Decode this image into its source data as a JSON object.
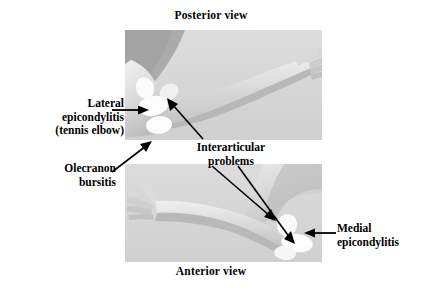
{
  "figure": {
    "kind": "anatomical-illustration",
    "background_color": "#ffffff",
    "text_color": "#000000"
  },
  "captions": {
    "top": "Posterior view",
    "bottom": "Anterior view"
  },
  "panels": [
    {
      "id": "posterior",
      "view": "Posterior view",
      "description": "Grayscale photograph of a right arm seen from behind, elbow at left, hand extended to the upper right",
      "markers": [
        {
          "name": "lateral-epicondyle-marker",
          "shape": "ellipse"
        },
        {
          "name": "olecranon-marker",
          "shape": "ellipse"
        },
        {
          "name": "joint-marker",
          "shape": "ellipse"
        }
      ]
    },
    {
      "id": "anterior",
      "view": "Anterior view",
      "description": "Grayscale photograph of an arm seen from the front, hand extended to the left, elbow at lower right",
      "markers": [
        {
          "name": "interarticular-marker",
          "shape": "ellipse"
        },
        {
          "name": "medial-epicondyle-marker",
          "shape": "ellipse"
        }
      ]
    }
  ],
  "annotations": [
    {
      "id": "lateral",
      "lines": [
        "Lateral",
        "epicondylitis",
        "(tennis elbow)"
      ],
      "text": "Lateral epicondylitis (tennis elbow)",
      "pointer": "arrow-right",
      "target_panel": "posterior"
    },
    {
      "id": "olecranon",
      "lines": [
        "Olecranon",
        "bursitis"
      ],
      "text": "Olecranon bursitis",
      "pointer": "arrow-up-right",
      "target_panel": "posterior"
    },
    {
      "id": "interarticular",
      "lines": [
        "Interarticular",
        "problems"
      ],
      "text": "Interarticular problems",
      "pointer": "arrow-up-left, arrow-down-right, arrow-down-right",
      "target_panel": "posterior and anterior"
    },
    {
      "id": "medial",
      "lines": [
        "Medial",
        "epicondylitis"
      ],
      "text": "Medial epicondylitis",
      "pointer": "arrow-left",
      "target_panel": "anterior"
    }
  ]
}
